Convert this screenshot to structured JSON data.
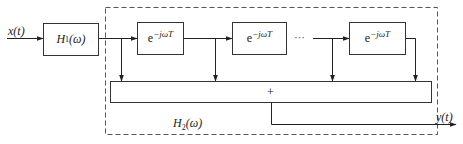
{
  "diagram": {
    "type": "block-diagram",
    "colors": {
      "stroke": "#333333",
      "background": "#ffffff",
      "dashed_border": "#555555"
    },
    "input": {
      "label_var": "x",
      "label_arg": "(t)"
    },
    "output": {
      "label_var": "y",
      "label_arg": "(t)"
    },
    "h1": {
      "label_var": "H",
      "label_sub": "1",
      "label_arg": "(ω)"
    },
    "h2": {
      "label_var": "H",
      "label_sub": "2",
      "label_arg": "(ω)"
    },
    "delay_blocks": [
      {
        "base": "e",
        "exponent": "−jωT"
      },
      {
        "base": "e",
        "exponent": "−jωT"
      },
      {
        "base": "e",
        "exponent": "−jωT"
      }
    ],
    "ellipsis": "···",
    "summer": {
      "symbol": "+"
    }
  }
}
